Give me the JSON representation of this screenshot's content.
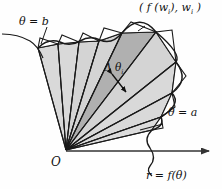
{
  "figure": {
    "name": "polar-area-sector-approximation",
    "origin_label": "O",
    "labels": {
      "theta_b": "θ = b",
      "theta_a": "θ = a",
      "curve": "r = f(θ)",
      "point": "( f (w",
      "point_sub1": "i",
      "point_mid": "), w",
      "point_sub2": "i",
      "point_end": " )",
      "delta_theta": "Δ θ",
      "delta_theta_sub": "i"
    },
    "colors": {
      "stroke": "#1a1a1a",
      "wedge_light": "#d9d9d9",
      "wedge_mid": "#cfcfcf",
      "wedge_dark": "#b0b0b0",
      "background": "#fefefe",
      "axis": "#333333"
    },
    "geometry": {
      "origin_x": 66,
      "origin_y": 150,
      "axis_end_x": 214,
      "axis_y": 151
    }
  }
}
